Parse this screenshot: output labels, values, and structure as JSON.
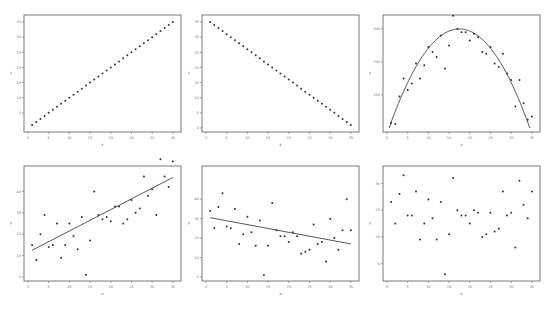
{
  "figure": {
    "layout": {
      "rows": 2,
      "cols": 3
    },
    "colors": {
      "frame": "#6b6b6b",
      "points": "#333333",
      "line": "#444444"
    }
  },
  "chart_data": [
    {
      "type": "scatter",
      "title": "",
      "xlabel": "x",
      "ylabel": "y",
      "xlim": [
        0,
        36
      ],
      "ylim": [
        0,
        36
      ],
      "xticks": [
        0,
        5,
        10,
        15,
        20,
        25,
        30,
        35
      ],
      "yticks": [
        5,
        10,
        15,
        20,
        25,
        30,
        35
      ],
      "grid": false,
      "x": [
        1,
        2,
        3,
        4,
        5,
        6,
        7,
        8,
        9,
        10,
        11,
        12,
        13,
        14,
        15,
        16,
        17,
        18,
        19,
        20,
        21,
        22,
        23,
        24,
        25,
        26,
        27,
        28,
        29,
        30,
        31,
        32,
        33,
        34,
        35
      ],
      "y": [
        1,
        2,
        3,
        4,
        5,
        6,
        7,
        8,
        9,
        10,
        11,
        12,
        13,
        14,
        15,
        16,
        17,
        18,
        19,
        20,
        21,
        22,
        23,
        24,
        25,
        26,
        27,
        28,
        29,
        30,
        31,
        32,
        33,
        34,
        35
      ],
      "fit": null
    },
    {
      "type": "scatter",
      "title": "",
      "xlabel": "x",
      "ylabel": "y",
      "xlim": [
        0,
        36
      ],
      "ylim": [
        0,
        36
      ],
      "xticks": [
        0,
        5,
        10,
        15,
        20,
        25,
        30,
        35
      ],
      "yticks": [
        0,
        5,
        10,
        15,
        20,
        25,
        30,
        35
      ],
      "grid": false,
      "x": [
        1,
        2,
        3,
        4,
        5,
        6,
        7,
        8,
        9,
        10,
        11,
        12,
        13,
        14,
        15,
        16,
        17,
        18,
        19,
        20,
        21,
        22,
        23,
        24,
        25,
        26,
        27,
        28,
        29,
        30,
        31,
        32,
        33,
        34,
        35
      ],
      "y": [
        35,
        34,
        33,
        32,
        31,
        30,
        29,
        28,
        27,
        26,
        25,
        24,
        23,
        22,
        21,
        20,
        19,
        18,
        17,
        16,
        15,
        14,
        13,
        12,
        11,
        10,
        9,
        8,
        7,
        6,
        5,
        4,
        3,
        2,
        1
      ],
      "fit": null
    },
    {
      "type": "scatter",
      "title": "",
      "xlabel": "x",
      "ylabel": "y",
      "xlim": [
        0,
        36
      ],
      "ylim": [
        0,
        330
      ],
      "xticks": [
        0,
        5,
        10,
        15,
        20,
        25,
        30,
        35
      ],
      "yticks": [
        100,
        200,
        300
      ],
      "grid": false,
      "x": [
        1,
        2,
        3,
        4,
        5,
        6,
        7,
        8,
        9,
        10,
        11,
        12,
        13,
        14,
        15,
        16,
        17,
        18,
        19,
        20,
        21,
        22,
        23,
        24,
        25,
        26,
        27,
        28,
        29,
        30,
        31,
        32,
        33,
        34,
        35
      ],
      "y": [
        15,
        12,
        95,
        150,
        115,
        135,
        195,
        150,
        190,
        245,
        230,
        215,
        280,
        180,
        250,
        340,
        300,
        290,
        290,
        265,
        285,
        275,
        230,
        225,
        245,
        195,
        185,
        225,
        165,
        145,
        65,
        145,
        75,
        25,
        35
      ],
      "fit": {
        "type": "quadratic",
        "vertex": [
          17.5,
          300
        ],
        "roots": [
          0.5,
          34.5
        ]
      }
    },
    {
      "type": "scatter",
      "title": "",
      "xlabel": "x",
      "ylabel": "y",
      "xlim": [
        0,
        36
      ],
      "ylim": [
        0,
        50
      ],
      "xticks": [
        0,
        5,
        10,
        15,
        20,
        25,
        30,
        35
      ],
      "yticks": [
        0,
        10,
        20,
        30,
        40
      ],
      "grid": false,
      "x": [
        1,
        2,
        3,
        4,
        5,
        6,
        7,
        8,
        9,
        10,
        11,
        12,
        13,
        14,
        15,
        16,
        17,
        18,
        19,
        20,
        21,
        22,
        23,
        24,
        25,
        26,
        27,
        28,
        29,
        30,
        31,
        32,
        33,
        34,
        35
      ],
      "y": [
        15,
        8,
        20,
        29,
        14,
        15,
        25,
        9,
        15,
        25,
        19,
        13,
        28,
        1,
        17,
        40,
        29,
        27,
        28,
        26,
        33,
        33,
        25,
        27,
        36,
        30,
        32,
        47,
        38,
        41,
        29,
        55,
        47,
        42,
        54
      ],
      "fit": {
        "type": "linear",
        "x": [
          1,
          35
        ],
        "y": [
          12.5,
          46.5
        ]
      }
    },
    {
      "type": "scatter",
      "title": "",
      "xlabel": "x",
      "ylabel": "y",
      "xlim": [
        0,
        36
      ],
      "ylim": [
        0,
        55
      ],
      "xticks": [
        0,
        5,
        10,
        15,
        20,
        25,
        30,
        35
      ],
      "yticks": [
        0,
        10,
        20,
        30,
        40
      ],
      "grid": false,
      "x": [
        1,
        2,
        3,
        4,
        5,
        6,
        7,
        8,
        9,
        10,
        11,
        12,
        13,
        14,
        15,
        16,
        17,
        18,
        19,
        20,
        21,
        22,
        23,
        24,
        25,
        26,
        27,
        28,
        29,
        30,
        31,
        32,
        33,
        34,
        35
      ],
      "y": [
        34,
        25,
        36,
        43,
        26,
        25,
        35,
        17,
        22,
        31,
        23,
        16,
        29,
        1,
        16,
        38,
        24,
        21,
        21,
        18,
        23,
        21,
        12,
        13,
        14,
        27,
        17,
        18,
        8,
        30,
        20,
        14,
        24,
        40,
        24
      ],
      "fit": {
        "type": "linear",
        "x": [
          1,
          35
        ],
        "y": [
          30.5,
          17
        ]
      }
    },
    {
      "type": "scatter",
      "title": "",
      "xlabel": "x",
      "ylabel": "y",
      "xlim": [
        0,
        36
      ],
      "ylim": [
        0,
        40
      ],
      "xticks": [
        0,
        5,
        10,
        15,
        20,
        25,
        30,
        35
      ],
      "yticks": [
        5,
        15,
        25,
        35
      ],
      "grid": false,
      "x": [
        1,
        2,
        3,
        4,
        5,
        6,
        7,
        8,
        9,
        10,
        11,
        12,
        13,
        14,
        15,
        16,
        17,
        18,
        19,
        20,
        21,
        22,
        23,
        24,
        25,
        26,
        27,
        28,
        29,
        30,
        31,
        32,
        33,
        34,
        35
      ],
      "y": [
        28,
        20,
        31,
        38,
        23,
        23,
        32,
        14,
        20,
        29,
        22,
        14,
        28,
        1,
        16,
        37,
        25,
        23,
        23,
        20,
        25,
        24,
        15,
        16,
        24,
        17,
        18,
        32,
        23,
        24,
        11,
        36,
        27,
        22,
        32
      ],
      "fit": null
    }
  ]
}
